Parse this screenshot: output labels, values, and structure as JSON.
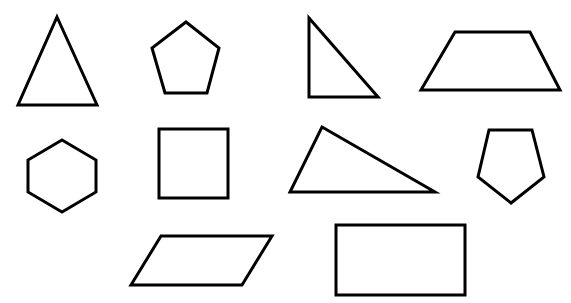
{
  "canvas": {
    "width": 571,
    "height": 303,
    "background_color": "#ffffff",
    "stroke_color": "#000000",
    "fill_color": "#ffffff",
    "stroke_width": 3,
    "description": "Worksheet of ten outlined geometric shapes arranged in three rows"
  },
  "shapes": [
    {
      "id": "triangle-isosceles",
      "name": "isosceles triangle",
      "sides": 3,
      "row": 1,
      "column": 1,
      "points": "57,17 97,105 18,105"
    },
    {
      "id": "pentagon-upright",
      "name": "pentagon",
      "sides": 5,
      "row": 1,
      "column": 2,
      "points": "186,22 219,48 207,93 165,93 152,48"
    },
    {
      "id": "triangle-right",
      "name": "right triangle",
      "sides": 3,
      "row": 1,
      "column": 3,
      "points": "309,18 378,97 309,97"
    },
    {
      "id": "trapezoid",
      "name": "trapezoid",
      "sides": 4,
      "row": 1,
      "column": 4,
      "points": "455,32 530,32 560,90 421,90"
    },
    {
      "id": "hexagon",
      "name": "hexagon",
      "sides": 6,
      "row": 2,
      "column": 1,
      "points": "62,140 96,160 96,192 62,212 28,192 28,160"
    },
    {
      "id": "square",
      "name": "square",
      "sides": 4,
      "row": 2,
      "column": 2,
      "points": "159,129 228,129 228,198 159,198"
    },
    {
      "id": "triangle-scalene",
      "name": "scalene triangle",
      "sides": 3,
      "row": 2,
      "column": 3,
      "points": "322,127 435,192 290,192"
    },
    {
      "id": "pentagon-inverted",
      "name": "inverted pentagon",
      "sides": 5,
      "row": 2,
      "column": 4,
      "points": "489,130 532,130 544,177 511,203 478,177"
    },
    {
      "id": "parallelogram",
      "name": "parallelogram",
      "sides": 4,
      "row": 3,
      "column": 1,
      "points": "161,236 272,236 242,285 131,285"
    },
    {
      "id": "rectangle",
      "name": "rectangle",
      "sides": 4,
      "row": 3,
      "column": 2,
      "points": "336,225 465,225 465,295 336,295"
    }
  ]
}
